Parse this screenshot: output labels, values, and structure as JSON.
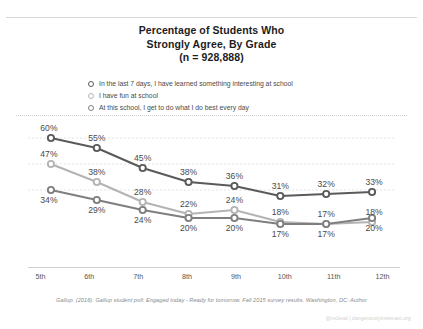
{
  "title": {
    "line1": "Percentage of Students Who",
    "line2": "Strongly Agree, By Grade",
    "line3": "(n = 928,888)"
  },
  "legend": {
    "position": "top",
    "items": [
      {
        "label": "In the last 7 days, I have learned something interesting at school",
        "marker": "open-circle",
        "color": "#5a5a5a"
      },
      {
        "label": "I have fun at school",
        "marker": "open-circle",
        "color": "#b4b4b4"
      },
      {
        "label": "At this school, I get to do what I do best every day",
        "marker": "open-circle",
        "color": "#7f7f7f"
      }
    ]
  },
  "source": "Gallup. (2016). Gallup student poll: Engaged today - Ready for tomorrow. Fall 2015 survey results. Washington, DC: Author",
  "watermark": "@mcleod | dangerouslyirrelevant.org",
  "chart_data": {
    "type": "line",
    "title": "Percentage of Students Who Strongly Agree, By Grade (n = 928,888)",
    "xlabel": "",
    "ylabel": "",
    "ylim": [
      0,
      65
    ],
    "grid": true,
    "grid_values": [
      60,
      47,
      34
    ],
    "legend_position": "top",
    "categories": [
      "5th",
      "6th",
      "7th",
      "8th",
      "9th",
      "10th",
      "11th",
      "12th"
    ],
    "series": [
      {
        "name": "In the last 7 days, I have learned something interesting at school",
        "color": "#5a5a5a",
        "values": [
          60,
          55,
          45,
          38,
          36,
          31,
          32,
          33
        ],
        "labels": [
          "60%",
          "55%",
          "45%",
          "38%",
          "36%",
          "31%",
          "32%",
          "33%"
        ],
        "label_position": [
          "above",
          "above",
          "above",
          "above",
          "above",
          "above",
          "above",
          "above"
        ]
      },
      {
        "name": "I have fun at school",
        "color": "#b4b4b4",
        "values": [
          47,
          38,
          28,
          22,
          24,
          18,
          17,
          18
        ],
        "labels": [
          "47%",
          "38%",
          "28%",
          "22%",
          "24%",
          "18%",
          "17%",
          "18%"
        ],
        "label_position": [
          "above",
          "above",
          "above",
          "above",
          "above",
          "above",
          "above",
          "above"
        ]
      },
      {
        "name": "At this school, I get to do what I do best every day",
        "color": "#7f7f7f",
        "values": [
          34,
          29,
          24,
          20,
          20,
          17,
          17,
          20
        ],
        "labels": [
          "34%",
          "29%",
          "24%",
          "20%",
          "20%",
          "17%",
          "17%",
          "20%"
        ],
        "label_position": [
          "below",
          "below",
          "below",
          "below",
          "below",
          "below",
          "below",
          "below"
        ]
      }
    ]
  }
}
